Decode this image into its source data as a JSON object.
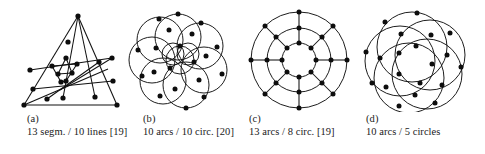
{
  "figure": {
    "background_color": "#ffffff",
    "ink_color": "#111111",
    "node_color": "#0d0d0d",
    "panels": [
      {
        "id": "a",
        "label": "(a)",
        "caption": "13 segm. / 10 lines [19]",
        "element_count": 13,
        "element_kind": "segm.",
        "container_count": 10,
        "container_kind": "lines",
        "reference": "[19]",
        "drawing_type": "straight-line-triangle-arrangement"
      },
      {
        "id": "b",
        "label": "(b)",
        "caption": "10 arcs / 10 circ. [20]",
        "element_count": 10,
        "element_kind": "arcs",
        "container_count": 10,
        "container_kind": "circ.",
        "reference": "[20]",
        "drawing_type": "circle-rosette-ten"
      },
      {
        "id": "c",
        "label": "(c)",
        "caption": "13 arcs / 8 circ. [19]",
        "element_count": 13,
        "element_kind": "arcs",
        "container_count": 8,
        "container_kind": "circ.",
        "reference": "[19]",
        "drawing_type": "concentric-rings-with-spokes"
      },
      {
        "id": "d",
        "label": "(d)",
        "caption": "10 arcs / 5 circles",
        "element_count": 10,
        "element_kind": "arcs",
        "container_count": 5,
        "container_kind": "circles",
        "reference": "",
        "drawing_type": "circle-rosette-five"
      }
    ]
  }
}
